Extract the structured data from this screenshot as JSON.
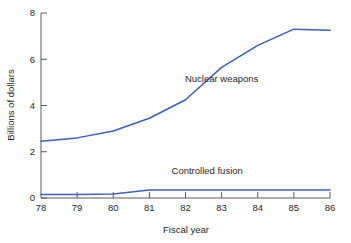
{
  "chart_data": {
    "type": "line",
    "title": "",
    "xlabel": "Fiscal year",
    "ylabel": "Billions of dollars",
    "x": [
      78,
      79,
      80,
      81,
      82,
      83,
      84,
      85,
      86
    ],
    "xtick_labels": [
      "78",
      "79",
      "80",
      "81",
      "82",
      "83",
      "84",
      "85",
      "86"
    ],
    "ytick_labels": [
      "0",
      "2",
      "4",
      "6",
      "8"
    ],
    "yticks": [
      0,
      2,
      4,
      6,
      8
    ],
    "xlim": [
      78,
      86
    ],
    "ylim": [
      0,
      8
    ],
    "grid": false,
    "legend_position": "inline-annotation",
    "series": [
      {
        "name": "Nuclear weapons",
        "color": "#3a5fc0",
        "values": [
          2.45,
          2.6,
          2.9,
          3.45,
          4.25,
          5.65,
          6.6,
          7.3,
          7.25
        ],
        "label_x": 83.0,
        "label_y": 5.0
      },
      {
        "name": "Controlled fusion",
        "color": "#3a5fc0",
        "values": [
          0.15,
          0.15,
          0.17,
          0.35,
          0.35,
          0.35,
          0.35,
          0.35,
          0.35
        ],
        "label_x": 82.6,
        "label_y": 1.05
      }
    ],
    "annotations": [
      {
        "text": "Nuclear weapons"
      },
      {
        "text": "Controlled fusion"
      }
    ]
  },
  "axes": {
    "y_title": "Billions of dollars",
    "x_title": "Fiscal year",
    "y_ticks": [
      {
        "label": "8"
      },
      {
        "label": "6"
      },
      {
        "label": "4"
      },
      {
        "label": "2"
      },
      {
        "label": "0"
      }
    ],
    "x_ticks": [
      {
        "label": "78"
      },
      {
        "label": "79"
      },
      {
        "label": "80"
      },
      {
        "label": "81"
      },
      {
        "label": "82"
      },
      {
        "label": "83"
      },
      {
        "label": "84"
      },
      {
        "label": "85"
      },
      {
        "label": "86"
      }
    ]
  },
  "colors": {
    "line": "#3a5fc0",
    "axis": "#5a5a5a",
    "text": "#1f1f1f",
    "background": "#ffffff"
  }
}
